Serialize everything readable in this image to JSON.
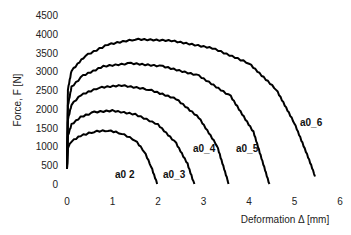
{
  "chart_data": {
    "type": "line",
    "title": "",
    "xlabel": "Deformation Δ [mm]",
    "ylabel": "Force, F [N]",
    "xlim": [
      0,
      6
    ],
    "ylim": [
      0,
      4500
    ],
    "xticks": [
      0,
      1,
      2,
      3,
      4,
      5,
      6
    ],
    "yticks": [
      0,
      500,
      1000,
      1500,
      2000,
      2500,
      3000,
      3500,
      4000,
      4500
    ],
    "grid": false,
    "legend": "inline labels near curve ends",
    "series": [
      {
        "name": "a0_2",
        "x": [
          0,
          0.02,
          0.1,
          0.3,
          0.6,
          0.9,
          1.2,
          1.5,
          1.7,
          1.85,
          1.98
        ],
        "y": [
          400,
          950,
          1120,
          1270,
          1380,
          1410,
          1330,
          1150,
          850,
          450,
          0
        ]
      },
      {
        "name": "a0_3",
        "x": [
          0,
          0.02,
          0.1,
          0.3,
          0.6,
          1.0,
          1.5,
          2.0,
          2.4,
          2.65,
          2.8
        ],
        "y": [
          400,
          1300,
          1600,
          1800,
          1930,
          1970,
          1870,
          1600,
          1100,
          550,
          0
        ]
      },
      {
        "name": "a0_4",
        "x": [
          0,
          0.02,
          0.1,
          0.3,
          0.7,
          1.2,
          1.8,
          2.4,
          2.9,
          3.3,
          3.55
        ],
        "y": [
          400,
          1700,
          2100,
          2350,
          2550,
          2610,
          2500,
          2250,
          1750,
          1000,
          0
        ]
      },
      {
        "name": "a0_5",
        "x": [
          0,
          0.02,
          0.1,
          0.35,
          0.8,
          1.4,
          2.1,
          2.9,
          3.6,
          4.1,
          4.45
        ],
        "y": [
          400,
          2100,
          2600,
          2900,
          3150,
          3230,
          3150,
          2900,
          2350,
          1400,
          0
        ]
      },
      {
        "name": "a0_6",
        "x": [
          0,
          0.02,
          0.1,
          0.4,
          0.9,
          1.5,
          2.3,
          3.2,
          4.0,
          4.6,
          5.0,
          5.3,
          5.45
        ],
        "y": [
          400,
          2500,
          3000,
          3400,
          3700,
          3840,
          3800,
          3600,
          3200,
          2500,
          1600,
          700,
          200
        ]
      }
    ]
  },
  "labels": {
    "xlabel": "Deformation Δ [mm]",
    "ylabel": "Force, F [N]",
    "series_labels": [
      "a0  2",
      "a0_3",
      "a0_4",
      "a0_5",
      "a0_6"
    ]
  }
}
